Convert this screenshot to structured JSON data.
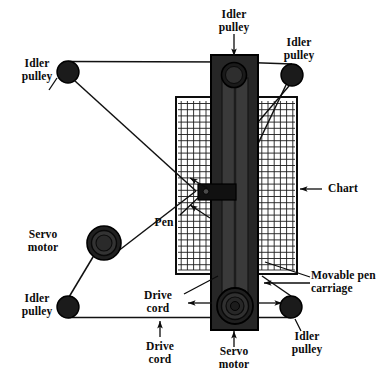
{
  "diagram": {
    "colors": {
      "ink": "#0b0b0b",
      "bar_fill": "#262626",
      "bar_stroke": "#000000",
      "grid": "#1a1a1a",
      "background": "#ffffff",
      "cord": "#111111"
    }
  },
  "labels": {
    "idler_pulley_top_left": "Idler\npulley",
    "idler_pulley_top_center": "Idler\npulley",
    "idler_pulley_top_right": "Idler\npulley",
    "idler_pulley_bottom_left": "Idler\npulley",
    "idler_pulley_bottom_right": "Idler\npulley",
    "servo_motor_left": "Servo\nmotor",
    "servo_motor_bottom": "Servo\nmotor",
    "pen": "Pen",
    "chart": "Chart",
    "movable_pen_carriage": "Movable pen\ncarriage",
    "drive_cord_middle": "Drive\ncord",
    "drive_cord_bottom": "Drive\ncord"
  },
  "components": {
    "idler_pulleys": [
      {
        "name": "top-left",
        "cx": 68,
        "cy": 72,
        "r": 11
      },
      {
        "name": "top-center",
        "cx": 234,
        "cy": 75,
        "r": 12
      },
      {
        "name": "top-right",
        "cx": 292,
        "cy": 75,
        "r": 11
      },
      {
        "name": "bottom-left",
        "cx": 68,
        "cy": 307,
        "r": 11
      },
      {
        "name": "bottom-right",
        "cx": 291,
        "cy": 307,
        "r": 11
      }
    ],
    "servo_motors": [
      {
        "name": "left",
        "cx": 104,
        "cy": 243,
        "r_outer": 17,
        "r_mid": 13,
        "r_inner": 9
      },
      {
        "name": "bottom",
        "cx": 235,
        "cy": 306,
        "r_outer": 18,
        "r_mid": 14,
        "r_inner": 9
      }
    ],
    "chart": {
      "x": 176,
      "y": 97,
      "width": 121,
      "height": 177,
      "grid_cell": 6.2
    },
    "carriage_bar": {
      "x": 211,
      "y": 55,
      "width": 47,
      "height": 275
    },
    "pen_carriage": {
      "x": 198,
      "y": 184,
      "width": 38,
      "height": 16
    },
    "pen_dot": {
      "cx": 206,
      "cy": 191,
      "r": 2.6
    }
  }
}
